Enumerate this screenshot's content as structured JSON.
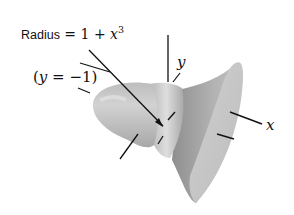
{
  "figure": {
    "title_label": {
      "prefix": "Radius",
      "equals": " = 1 + ",
      "variable": "x",
      "exponent": "3"
    },
    "axis_label_line": {
      "open": "(",
      "variable": "y",
      "rest": " = −1)"
    },
    "y_axis_label": "y",
    "x_axis_label": "x",
    "colors": {
      "surface_light": "#d4d4d4",
      "surface_mid": "#b9b9b9",
      "surface_dark": "#9a9a9a",
      "ink": "#111111"
    }
  }
}
